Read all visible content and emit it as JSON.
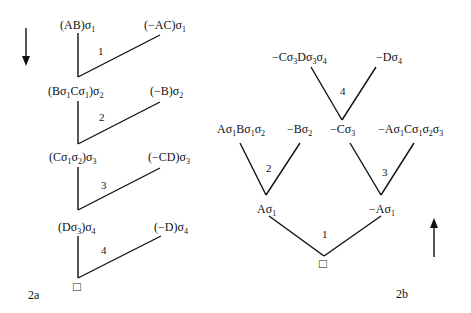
{
  "diagram_a": {
    "caption": "2a",
    "arrow_direction": "down",
    "nodes": [
      {
        "left": {
          "pre": "(AB)σ",
          "sub": "1",
          "post": ""
        },
        "right": {
          "pre": "(−AC)σ",
          "sub": "1",
          "post": ""
        }
      },
      {
        "left": {
          "pre": "(Bσ",
          "sub": "1",
          "mid1": "Cσ",
          "sub2": "1",
          "post": ")σ",
          "sub3": "2"
        },
        "right": {
          "pre": "(−B)σ",
          "sub": "2",
          "post": ""
        }
      },
      {
        "left": {
          "pre": "(Cσ",
          "sub": "1",
          "mid1": "σ",
          "sub2": "2",
          "post": ")σ",
          "sub3": "3"
        },
        "right": {
          "pre": "(−CD)σ",
          "sub": "3",
          "post": ""
        }
      },
      {
        "left": {
          "pre": "(Dσ",
          "sub": "3",
          "post": ")σ",
          "sub3": "4"
        },
        "right": {
          "pre": "(−D)σ",
          "sub": "4",
          "post": ""
        }
      }
    ],
    "step_labels": [
      "1",
      "2",
      "3",
      "4"
    ],
    "root_symbol": "□"
  },
  "diagram_b": {
    "caption": "2b",
    "arrow_direction": "up",
    "level3": {
      "left": {
        "pre": "−Cσ",
        "sub": "3",
        "mid1": "Dσ",
        "sub2": "3",
        "post": "σ",
        "sub3": "4"
      },
      "right": {
        "pre": "−Dσ",
        "sub": "4"
      }
    },
    "level2": {
      "a": {
        "pre": "Aσ",
        "sub": "1",
        "mid1": "Bσ",
        "sub2": "1",
        "post": "σ",
        "sub3": "2"
      },
      "b": {
        "pre": "−Bσ",
        "sub": "2"
      },
      "c": {
        "pre": "−Cσ",
        "sub": "3"
      },
      "d": {
        "pre": "−Aσ",
        "sub": "1",
        "mid1": "Cσ",
        "sub2": "1",
        "mid2": "σ",
        "sub3": "2",
        "post": "σ",
        "sub4": "3"
      }
    },
    "level1": {
      "left": {
        "pre": "Aσ",
        "sub": "1"
      },
      "right": {
        "pre": "−Aσ",
        "sub": "1"
      }
    },
    "step_labels": {
      "root": "1",
      "left": "2",
      "right": "3",
      "top": "4"
    },
    "root_symbol": "□"
  }
}
